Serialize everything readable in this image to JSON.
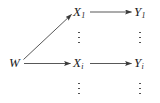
{
  "figure": {
    "type": "directed-graph-diagram",
    "background_color": "#ffffff",
    "ink_color": "#333333",
    "width": 160,
    "height": 103
  },
  "nodes": {
    "w": {
      "base": "W",
      "sub": "",
      "label": "W",
      "x": 16,
      "y": 63
    },
    "x1": {
      "base": "X",
      "sub": "1",
      "label": "X1",
      "x": 80,
      "y": 12
    },
    "xi": {
      "base": "X",
      "sub": "i",
      "label": "Xi",
      "x": 80,
      "y": 63
    },
    "y1": {
      "base": "Y",
      "sub": "1",
      "label": "Y1",
      "x": 141,
      "y": 12
    },
    "yi": {
      "base": "Y",
      "sub": "i",
      "label": "Yi",
      "x": 141,
      "y": 63
    }
  },
  "edges": [
    {
      "name": "w-to-x1",
      "from": "W",
      "to": "X1",
      "style": "solid-arrow"
    },
    {
      "name": "w-to-xi",
      "from": "W",
      "to": "Xi",
      "style": "solid-arrow"
    },
    {
      "name": "x1-to-y1",
      "from": "X1",
      "to": "Y1",
      "style": "solid-arrow"
    },
    {
      "name": "xi-to-yi",
      "from": "Xi",
      "to": "Yi",
      "style": "solid-arrow"
    }
  ],
  "ellipses": [
    {
      "name": "x-column-middle",
      "glyph": "vertical-ellipsis",
      "dots": 3
    },
    {
      "name": "y-column-middle",
      "glyph": "vertical-ellipsis",
      "dots": 3
    },
    {
      "name": "x-column-bottom",
      "glyph": "vertical-ellipsis",
      "dots": 3
    },
    {
      "name": "y-column-bottom",
      "glyph": "vertical-ellipsis",
      "dots": 3
    }
  ]
}
